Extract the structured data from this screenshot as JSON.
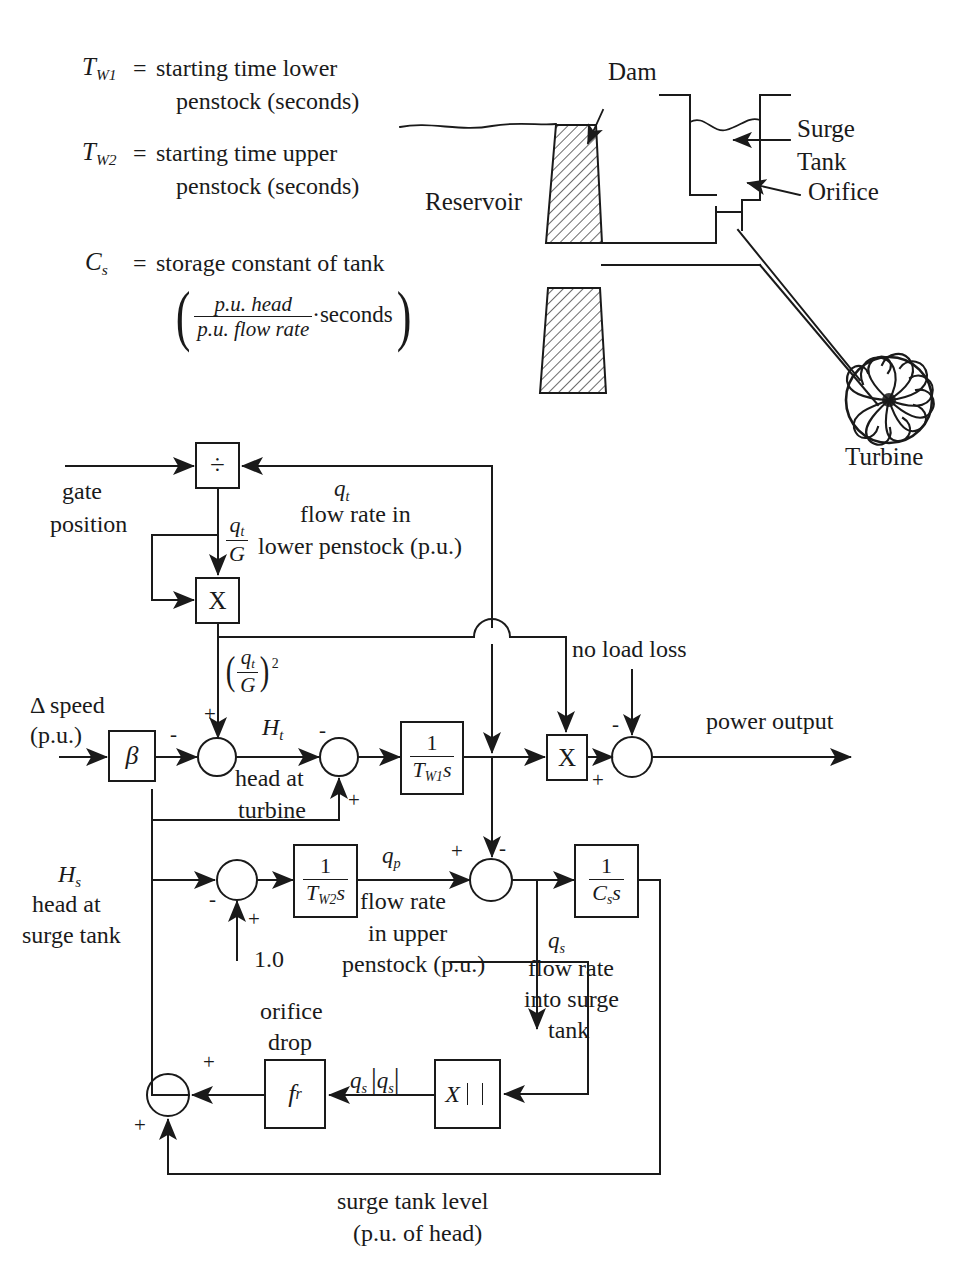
{
  "legend": {
    "items": [
      {
        "sym": "T",
        "sub": "W1",
        "eq": "=",
        "line1": "starting time lower",
        "line2": "penstock (seconds)"
      },
      {
        "sym": "T",
        "sub": "W2",
        "eq": "=",
        "line1": "starting time upper",
        "line2": "penstock (seconds)"
      },
      {
        "sym": "C",
        "sub": "s",
        "eq": "=",
        "line1": "storage constant of tank",
        "line2": ""
      }
    ],
    "cs_units": {
      "numerator": "p.u. head",
      "denominator": "p.u. flow rate",
      "dot": "·",
      "tail": "seconds"
    }
  },
  "schematic": {
    "labels": {
      "dam": "Dam",
      "reservoir": "Reservoir",
      "surge_tank_line1": "Surge",
      "surge_tank_line2": "Tank",
      "orifice": "Orifice",
      "turbine": "Turbine"
    }
  },
  "diagram": {
    "blocks": {
      "divide": "÷",
      "multiply_top": "X",
      "beta": "β",
      "tw1_num": "1",
      "tw1_den_sym": "T",
      "tw1_den_sub": "W1",
      "tw1_den_s": "s",
      "multiply_right": "X",
      "tw2_num": "1",
      "tw2_den_sym": "T",
      "tw2_den_sub": "W2",
      "tw2_den_s": "s",
      "cs_num": "1",
      "cs_den_sym": "C",
      "cs_den_sub": "s",
      "cs_den_s": "s",
      "fr_sym": "f",
      "fr_sub": "r",
      "absmult": "X"
    },
    "labels": {
      "gate_position_l1": "gate",
      "gate_position_l2": "position",
      "qt_sym": "q",
      "qt_sub": "t",
      "qt_l1": "flow rate in",
      "qt_l2": "lower penstock (p.u.)",
      "qt_over_g_num_sym": "q",
      "qt_over_g_num_sub": "t",
      "qt_over_g_den": "G",
      "qt_over_g_sq_sup": "2",
      "delta_speed_l1": "Δ speed",
      "delta_speed_l2": "(p.u.)",
      "ht_sym": "H",
      "ht_sub": "t",
      "ht_l1": "head at",
      "ht_l2": "turbine",
      "no_load_loss": "no load loss",
      "power_output": "power output",
      "hs_sym": "H",
      "hs_sub": "s",
      "hs_l1": "head at",
      "hs_l2": "surge tank",
      "one_point_zero": "1.0",
      "qp_sym": "q",
      "qp_sub": "p",
      "qp_l1": "flow rate",
      "qp_l2": "in  upper",
      "qp_l3": "penstock (p.u.)",
      "qs_sym": "q",
      "qs_sub": "s",
      "qs_l1": "flow rate",
      "qs_l2": "into surge",
      "qs_l3": "tank",
      "orifice_drop_l1": "orifice",
      "orifice_drop_l2": "drop",
      "qs_absqs_sym": "q",
      "qs_absqs_sub": "s",
      "surge_level_l1": "surge tank level",
      "surge_level_l2": "(p.u. of head)"
    },
    "signs": {
      "sum1_plus": "+",
      "sum1_minus": "-",
      "sum2_minus": "-",
      "sum2_plus": "+",
      "sum3_minus": "-",
      "sum3_plus": "+",
      "sum4_minus": "-",
      "sum4_plus": "+",
      "sum5_plus": "+",
      "sum5_minus": "-",
      "sum6_plus_top": "+",
      "sum6_plus_bottom": "+"
    }
  },
  "colors": {
    "ink": "#1a1a1a",
    "paper": "#ffffff",
    "hatch": "#555555"
  }
}
